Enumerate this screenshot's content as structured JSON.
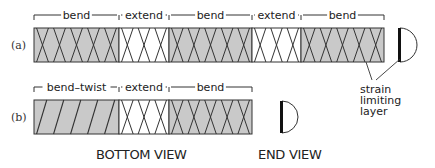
{
  "colors": {
    "fill_gray": "#c9c9c9",
    "fill_white": "#ffffff",
    "stroke": "#333333",
    "layer": "#111111"
  },
  "rows": [
    {
      "label": "(a)",
      "label_pos": [
        10,
        50
      ],
      "bar": {
        "y": 28,
        "h": 34
      },
      "segments": [
        {
          "name": "bend",
          "x0": 34,
          "x1": 119,
          "fill": "gray",
          "pattern": "x",
          "count": 5
        },
        {
          "name": "extend",
          "x0": 119,
          "x1": 169,
          "fill": "white",
          "pattern": "x",
          "count": 3
        },
        {
          "name": "bend",
          "x0": 169,
          "x1": 252,
          "fill": "gray",
          "pattern": "x",
          "count": 5
        },
        {
          "name": "extend",
          "x0": 252,
          "x1": 301,
          "fill": "white",
          "pattern": "x",
          "count": 3
        },
        {
          "name": "bend",
          "x0": 301,
          "x1": 384,
          "fill": "gray",
          "pattern": "x",
          "count": 5
        }
      ],
      "end_view": {
        "x": 400,
        "y0": 28,
        "y1": 62
      }
    },
    {
      "label": "(b)",
      "label_pos": [
        10,
        122
      ],
      "bar": {
        "y": 100,
        "h": 34
      },
      "segments": [
        {
          "name": "bend–twist",
          "x0": 34,
          "x1": 119,
          "fill": "gray",
          "pattern": "slash",
          "count": 5
        },
        {
          "name": "extend",
          "x0": 119,
          "x1": 169,
          "fill": "white",
          "pattern": "x",
          "count": 3
        },
        {
          "name": "bend",
          "x0": 169,
          "x1": 252,
          "fill": "gray",
          "pattern": "x",
          "count": 5
        }
      ],
      "end_view": {
        "x": 282,
        "y0": 101,
        "y1": 133
      }
    }
  ],
  "annotation": {
    "text_lines": [
      "strain",
      "limiting",
      "layer"
    ],
    "text_pos": [
      360,
      85
    ],
    "leaders": [
      [
        [
          366,
          62
        ],
        [
          372,
          80
        ]
      ],
      [
        [
          400,
          59
        ],
        [
          376,
          80
        ]
      ]
    ]
  },
  "captions": {
    "bottom_view": "BOTTOM VIEW",
    "end_view": "END VIEW"
  }
}
